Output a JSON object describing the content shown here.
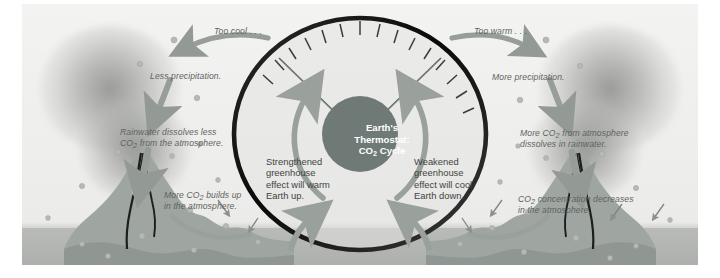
{
  "figure": {
    "title": "Earth's Thermostat: CO2 Cycle",
    "hub": {
      "line1": "Earth's",
      "line2": "Thermostat:",
      "line3_pre": "CO",
      "line3_sub": "2",
      "line3_post": " Cycle"
    },
    "gauge": {
      "left_cue": "Too cool . . .",
      "right_cue": "Too warm . . .",
      "tick_count": 15,
      "dial_color": "#121212",
      "hub_color": "#6f7a77",
      "arrow_color": "#9aa09c"
    },
    "left_branch": {
      "step1": "Less precipitation.",
      "step2_line1": "Rainwater dissolves less",
      "step2_line2_pre": "CO",
      "step2_line2_sub": "2",
      "step2_line2_post": " from the atmosphere.",
      "step3_line1_pre": "More CO",
      "step3_line1_sub": "2",
      "step3_line1_post": " builds up",
      "step3_line2": "in the atmosphere.",
      "outcome_l1": "Strengthened",
      "outcome_l2": "greenhouse",
      "outcome_l3": "effect will warm",
      "outcome_l4": "Earth up."
    },
    "right_branch": {
      "step1": "More precipitation.",
      "step2_line1_pre": "More CO",
      "step2_line1_sub": "2",
      "step2_line1_post": " from atmosphere",
      "step2_line2": "dissolves in rainwater.",
      "step3_line1_pre": "CO",
      "step3_line1_sub": "2",
      "step3_line1_post": " concentration decreases",
      "step3_line2": "in the atmosphere.",
      "outcome_l1": "Weakened",
      "outcome_l2": "greenhouse",
      "outcome_l3": "effect will cool",
      "outcome_l4": "Earth down."
    },
    "scenery": {
      "left_volcano": "volcano-left",
      "right_volcano": "volcano-right",
      "left_plume": "smoke-plume-left",
      "right_plume": "smoke-plume-right",
      "ground": "ground-band"
    },
    "colors": {
      "background": "#efefed",
      "ground": "#b4b6b3",
      "text": "#5e6360",
      "hub_fill": "#6f7a77",
      "arrow": "#9aa09c",
      "ring": "#111111",
      "volcano": "#9fa5a1"
    }
  }
}
